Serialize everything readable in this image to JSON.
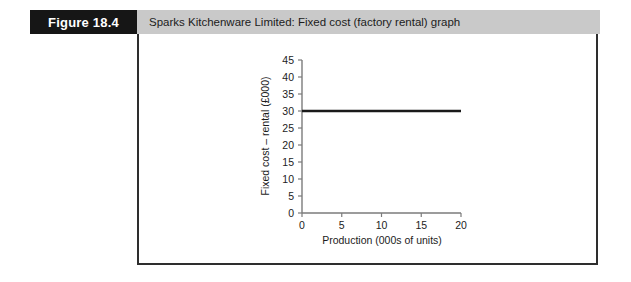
{
  "figure": {
    "number_label": "Figure 18.4",
    "title": "Sparks Kitchenware Limited: Fixed cost (factory rental) graph",
    "number_box_color": "#161616",
    "title_bar_color": "#c9c9c9",
    "frame_border_color": "#2e2e2e"
  },
  "chart_data": {
    "type": "line",
    "title": "",
    "xlabel": "Production (000s of units)",
    "ylabel": "Fixed cost – rental (£000)",
    "x": [
      0,
      20
    ],
    "values": [
      30,
      30
    ],
    "series": [
      {
        "name": "Fixed cost – factory rental",
        "values": [
          30,
          30
        ]
      }
    ],
    "xlim": [
      0,
      20
    ],
    "ylim": [
      0,
      45
    ],
    "xticks": [
      0,
      5,
      10,
      15,
      20
    ],
    "yticks": [
      0,
      5,
      10,
      15,
      20,
      25,
      30,
      35,
      40,
      45
    ],
    "xtick_labels": [
      "0",
      "5",
      "10",
      "15",
      "20"
    ],
    "ytick_labels": [
      "0",
      "5",
      "10",
      "15",
      "20",
      "25",
      "30",
      "35",
      "40",
      "45"
    ],
    "grid": false,
    "legend": false,
    "legend_position": "none",
    "line_color": "#1a1a1a",
    "axis_color": "#7b7b7b"
  }
}
